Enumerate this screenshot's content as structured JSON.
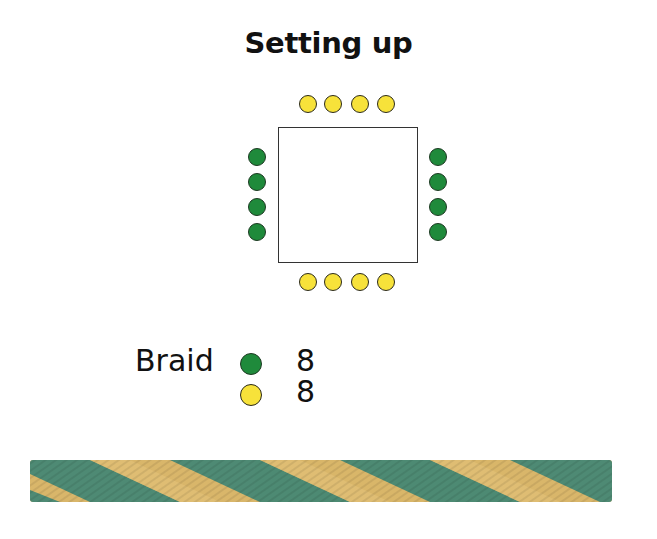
{
  "title": "Setting up",
  "diagram": {
    "disk": {
      "shape": "square",
      "border_color": "#333333"
    },
    "slots": {
      "top": [
        "yellow",
        "yellow",
        "yellow",
        "yellow"
      ],
      "bottom": [
        "yellow",
        "yellow",
        "yellow",
        "yellow"
      ],
      "left": [
        "green",
        "green",
        "green",
        "green"
      ],
      "right": [
        "green",
        "green",
        "green",
        "green"
      ]
    }
  },
  "legend": {
    "label": "Braid",
    "items": [
      {
        "color_name": "green",
        "color": "#1f8a3b",
        "count": "8"
      },
      {
        "color_name": "yellow",
        "color": "#f7e23a",
        "count": "8"
      }
    ]
  },
  "braid_sample": {
    "colors": [
      "#4e8a74",
      "#d9b66a"
    ],
    "description": "finished spiral braid sample"
  },
  "colors": {
    "yellow_bead": "#f7e23a",
    "green_bead": "#1f8a3b"
  }
}
